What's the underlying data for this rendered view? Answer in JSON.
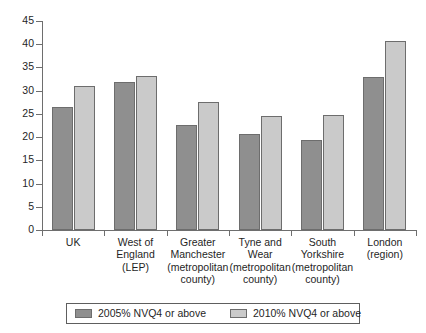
{
  "chart_data": {
    "type": "bar",
    "title": "",
    "subtitle": "",
    "xlabel": "",
    "ylabel": "",
    "ylim": [
      0,
      45
    ],
    "ytick_step": 5,
    "grid": false,
    "legend_position": "bottom",
    "categories": [
      "UK",
      "West of\nEngland\n(LEP)",
      "Greater\nManchester\n(metropolitan\ncounty)",
      "Tyne and\nWear\n(metropolitan\ncounty)",
      "South\nYorkshire\n(metropolitan\ncounty)",
      "London\n(region)"
    ],
    "ytick_labels": [
      "0",
      "5",
      "10",
      "15",
      "20",
      "25",
      "30",
      "35",
      "40",
      "45"
    ],
    "series": [
      {
        "name": "2005% NVQ4 or above",
        "color": "#8f8f8f",
        "values": [
          26.4,
          31.9,
          22.7,
          20.7,
          19.3,
          32.9
        ]
      },
      {
        "name": "2010% NVQ4 or above",
        "color": "#cacaca",
        "values": [
          31.1,
          33.2,
          27.5,
          24.6,
          24.7,
          40.8
        ]
      }
    ]
  },
  "legend": {
    "entries": [
      {
        "label": "2005% NVQ4 or above"
      },
      {
        "label": "2010% NVQ4 or above"
      }
    ]
  }
}
